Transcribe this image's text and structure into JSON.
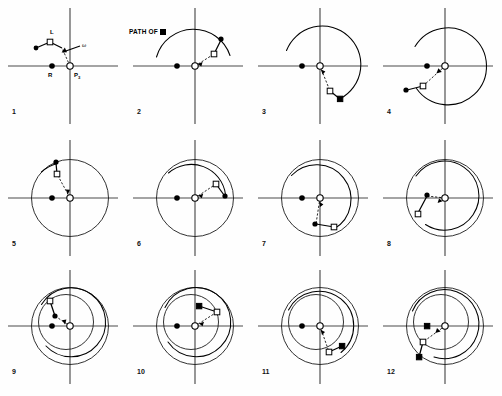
{
  "figure": {
    "type": "mechanism-motion-sequence",
    "panel_count": 12,
    "grid": {
      "rows": 3,
      "cols": 4
    },
    "background": "#ffffff",
    "ink": "#000000"
  },
  "annotations": {
    "path_of_label": "PATH OF",
    "path_of_marker": "filled-square",
    "link_label": "L",
    "crank_label": "R",
    "pivot_label": "P",
    "pivot_subscript": "3",
    "omega_label": "ω"
  },
  "markers": {
    "pivot": "open-circle",
    "crank_pin": "filled-circle",
    "coupler_joint": "open-square",
    "tracer_point": "filled-square"
  },
  "panels": [
    {
      "number": "1",
      "arc_sweep_deg": 0,
      "has_outer_circle": false,
      "has_inner_circle": false,
      "labeled": true
    },
    {
      "number": "2",
      "arc_sweep_deg": 120,
      "has_outer_circle": false,
      "has_inner_circle": false,
      "labeled": false
    },
    {
      "number": "3",
      "arc_sweep_deg": 210,
      "has_outer_circle": false,
      "has_inner_circle": false,
      "labeled": false
    },
    {
      "number": "4",
      "arc_sweep_deg": 290,
      "has_outer_circle": false,
      "has_inner_circle": false,
      "labeled": false
    },
    {
      "number": "5",
      "arc_sweep_deg": 360,
      "has_outer_circle": true,
      "has_inner_circle": false,
      "labeled": false
    },
    {
      "number": "6",
      "arc_sweep_deg": 60,
      "has_outer_circle": true,
      "has_inner_circle": false,
      "labeled": false
    },
    {
      "number": "7",
      "arc_sweep_deg": 150,
      "has_outer_circle": true,
      "has_inner_circle": false,
      "labeled": false
    },
    {
      "number": "8",
      "arc_sweep_deg": 240,
      "has_outer_circle": true,
      "has_inner_circle": false,
      "labeled": false
    },
    {
      "number": "9",
      "arc_sweep_deg": 330,
      "has_outer_circle": true,
      "has_inner_circle": true,
      "labeled": false
    },
    {
      "number": "10",
      "arc_sweep_deg": 40,
      "has_outer_circle": true,
      "has_inner_circle": true,
      "labeled": false
    },
    {
      "number": "11",
      "arc_sweep_deg": 130,
      "has_outer_circle": true,
      "has_inner_circle": true,
      "labeled": false
    },
    {
      "number": "12",
      "arc_sweep_deg": 220,
      "has_outer_circle": true,
      "has_inner_circle": true,
      "labeled": false
    }
  ]
}
